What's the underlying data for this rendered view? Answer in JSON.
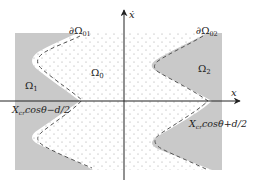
{
  "diagram": {
    "type": "phase-plane-regions",
    "colors": {
      "background": "#ffffff",
      "shaded_region": "#c9c9c9",
      "dots": "#9a9a9a",
      "dashed_boundary": "#555555",
      "axes": "#222222"
    },
    "axes": {
      "x_label": "x",
      "y_label": "ẋ"
    },
    "regions": {
      "center": {
        "label_base": "Ω",
        "label_sub": "0"
      },
      "left": {
        "label_base": "Ω",
        "label_sub": "1"
      },
      "right": {
        "label_base": "Ω",
        "label_sub": "2"
      }
    },
    "boundaries": {
      "left": {
        "label_base": "∂Ω",
        "label_sub": "01"
      },
      "right": {
        "label_base": "∂Ω",
        "label_sub": "02"
      }
    },
    "annotations": {
      "left_intercept": {
        "base": "X",
        "sub": "cr",
        "rest": "cosθ−d/2"
      },
      "right_intercept": {
        "base": "X",
        "sub": "cr",
        "rest": "cosθ+d/2"
      }
    }
  }
}
